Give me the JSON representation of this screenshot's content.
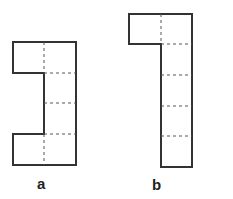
{
  "figures": [
    {
      "label": "a",
      "description": "C-shaped net of 6 squares: 2 columns tall-right column of 4, left squares at top and bottom"
    },
    {
      "label": "b",
      "description": "Net of 6 squares: column of 5 with one square at top-left"
    }
  ],
  "colors": {
    "outline": "#333333",
    "dashed": "#555555"
  }
}
